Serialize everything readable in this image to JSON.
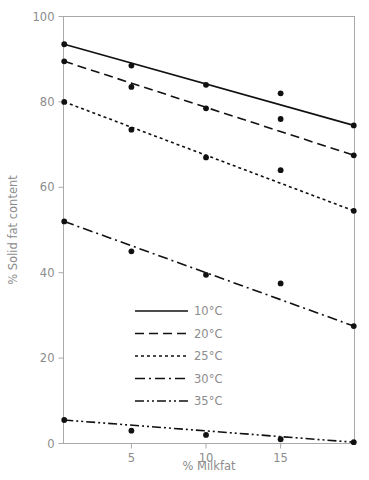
{
  "chart_data": {
    "type": "line",
    "title": "",
    "xlabel": "% Milkfat",
    "ylabel": "% Solid fat content",
    "xlim": [
      0.45,
      19.95
    ],
    "ylim": [
      0,
      100
    ],
    "xticks": [
      5,
      10,
      15
    ],
    "xticklabels": [
      "5",
      "10",
      "15"
    ],
    "yticks": [
      0,
      20,
      40,
      60,
      80,
      100
    ],
    "yticklabels": [
      "0",
      "20",
      "40",
      "60",
      "80",
      "100"
    ],
    "grid": false,
    "legend_position": "center-left-lower",
    "marker": "filled-circle",
    "line_color": "#111111",
    "axis_color": "#aaaaaa",
    "text_color": "#8c8c8c",
    "x": [
      0.5,
      5,
      10,
      15,
      19.9
    ],
    "series": [
      {
        "name": "10°C",
        "label": "10°C",
        "linestyle": "solid",
        "dasharray": "",
        "values": [
          93.5,
          88.5,
          84,
          79.5,
          74.5
        ],
        "fit_x": [
          0.5,
          19.9
        ],
        "fit_values": [
          93.5,
          74.5
        ],
        "markers_x": [
          0.5,
          5,
          10,
          19.9
        ],
        "markers_y": [
          93.5,
          88.5,
          84,
          74.5
        ],
        "outlier_x": [
          15
        ],
        "outlier_y": [
          82
        ]
      },
      {
        "name": "20°C",
        "label": "20°C",
        "linestyle": "dashed",
        "dasharray": "9,5",
        "values": [
          89.5,
          83.5,
          78.5,
          73,
          67.5
        ],
        "fit_x": [
          0.5,
          19.9
        ],
        "fit_values": [
          89.5,
          67.5
        ],
        "markers_x": [
          0.5,
          5,
          10,
          19.9
        ],
        "markers_y": [
          89.5,
          83.5,
          78.5,
          67.5
        ],
        "outlier_x": [
          15
        ],
        "outlier_y": [
          76
        ]
      },
      {
        "name": "25°C",
        "label": "25°C",
        "linestyle": "dotted",
        "dasharray": "3,3",
        "values": [
          80,
          73.5,
          67,
          60.5,
          54.5
        ],
        "fit_x": [
          0.5,
          19.9
        ],
        "fit_values": [
          80,
          54.5
        ],
        "markers_x": [
          0.5,
          5,
          10,
          19.9
        ],
        "markers_y": [
          80,
          73.5,
          67,
          54.5
        ],
        "outlier_x": [
          15
        ],
        "outlier_y": [
          64
        ]
      },
      {
        "name": "30°C",
        "label": "30°C",
        "linestyle": "dashdot",
        "dasharray": "10,4,2,4",
        "values": [
          52,
          45,
          39.5,
          33.5,
          27.5
        ],
        "fit_x": [
          0.5,
          19.9
        ],
        "fit_values": [
          52,
          27.5
        ],
        "markers_x": [
          0.5,
          5,
          10,
          19.9
        ],
        "markers_y": [
          52,
          45,
          39.5,
          27.5
        ],
        "outlier_x": [
          15
        ],
        "outlier_y": [
          37.5
        ]
      },
      {
        "name": "35°C",
        "label": "35°C",
        "linestyle": "dashdotdot",
        "dasharray": "9,3,2,3,2,3",
        "values": [
          5.5,
          3,
          2,
          1,
          0.3
        ],
        "fit_x": [
          0.5,
          19.9
        ],
        "fit_values": [
          5.5,
          0.3
        ],
        "markers_x": [
          0.5,
          5,
          10,
          15,
          19.9
        ],
        "markers_y": [
          5.5,
          3,
          2,
          1,
          0.3
        ],
        "outlier_x": [],
        "outlier_y": []
      }
    ]
  },
  "legend": {
    "items": [
      {
        "label": "10°C"
      },
      {
        "label": "20°C"
      },
      {
        "label": "25°C"
      },
      {
        "label": "30°C"
      },
      {
        "label": "35°C"
      }
    ]
  },
  "axes": {
    "x_title": "% Milkfat",
    "y_title": "% Solid fat content",
    "x_tick_labels": [
      "5",
      "10",
      "15"
    ],
    "y_tick_labels": [
      "0",
      "20",
      "40",
      "60",
      "80",
      "100"
    ]
  }
}
